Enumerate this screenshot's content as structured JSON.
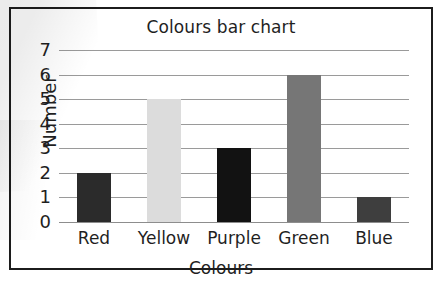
{
  "chart_data": {
    "type": "bar",
    "title": "Colours bar chart",
    "xlabel": "Colours",
    "ylabel": "Number",
    "categories": [
      "Red",
      "Yellow",
      "Purple",
      "Green",
      "Blue"
    ],
    "values": [
      2,
      5,
      3,
      6,
      1
    ],
    "bar_colors": [
      "#2b2b2b",
      "#dcdcdc",
      "#121212",
      "#767676",
      "#3e3e3e"
    ],
    "ylim": [
      0,
      7
    ],
    "ytick_labels": [
      "7",
      "6",
      "5",
      "4",
      "3",
      "2",
      "1",
      "0"
    ],
    "ytick_values": [
      7,
      6,
      5,
      4,
      3,
      2,
      1,
      0
    ],
    "grid": true,
    "grid_axis": "y",
    "legend": false,
    "frame": true,
    "colors": {
      "frame": "#1c1c1c",
      "gridline": "#9a9a9a",
      "text": "#1f1f1f",
      "background": "#ffffff"
    }
  }
}
